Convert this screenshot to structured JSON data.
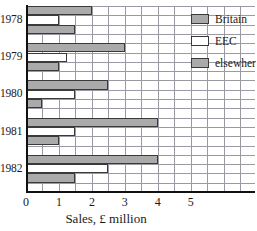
{
  "chart_data": {
    "type": "bar",
    "orientation": "horizontal",
    "title": "",
    "xlabel": "Sales, £ million",
    "ylabel": "",
    "categories": [
      "1978",
      "1979",
      "1980",
      "1981",
      "1982"
    ],
    "series": [
      {
        "name": "Britain",
        "key": "britain",
        "color": "#aaaaaa",
        "values": [
          2.0,
          3.0,
          2.5,
          4.0,
          4.0
        ]
      },
      {
        "name": "EEC",
        "key": "eec",
        "color": "#ffffff",
        "values": [
          1.0,
          1.25,
          1.5,
          1.5,
          2.5
        ]
      },
      {
        "name": "elsewher",
        "key": "elsewhere",
        "color": "#aaaaaa",
        "values": [
          1.5,
          1.0,
          0.5,
          1.0,
          1.5
        ]
      }
    ],
    "xlim": [
      0,
      6.95
    ],
    "xticks": [
      0,
      1,
      2,
      3,
      4,
      5
    ],
    "xticklabels": [
      "0",
      "1",
      "2",
      "3",
      "4",
      "5"
    ],
    "grid": true,
    "grid_color": "#9a9aa2",
    "legend_position": "top-right",
    "legend_entries": [
      "Britain",
      "EEC",
      "elsewher"
    ]
  },
  "axis": {
    "x_label": "Sales, £ million",
    "tick_labels": [
      "0",
      "1",
      "2",
      "3",
      "4",
      "5"
    ],
    "category_labels": [
      "1978",
      "1979",
      "1980",
      "1981",
      "1982"
    ]
  },
  "legend": {
    "items": [
      {
        "label": "Britain"
      },
      {
        "label": "EEC"
      },
      {
        "label": "elsewher"
      }
    ]
  }
}
